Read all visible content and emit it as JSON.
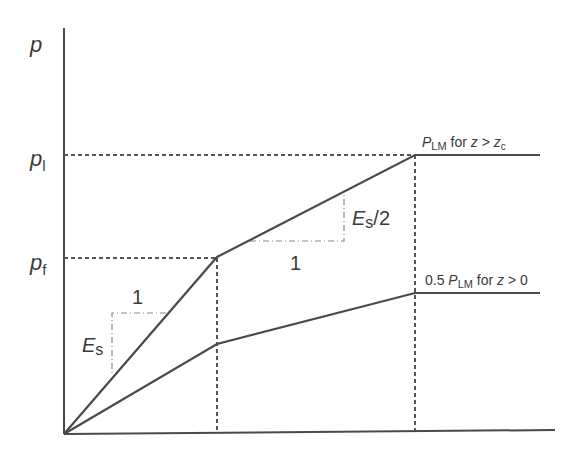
{
  "diagram": {
    "type": "p-y curve (bilinear with plateau)",
    "y_axis_label": "p",
    "y_ticks": [
      {
        "base": "p",
        "sub": "l"
      },
      {
        "base": "p",
        "sub": "f"
      }
    ],
    "slope_labels": {
      "initial": {
        "rise": "E",
        "rise_sub": "s",
        "run": "1"
      },
      "second": {
        "rise": "E",
        "rise_sub": "s",
        "rise_suffix": "/2",
        "run": "1"
      }
    },
    "curve_labels": {
      "upper": {
        "prefix": "",
        "base": "P",
        "sub": "LM",
        "suffix": " for ",
        "var": "z",
        "op": " > ",
        "var2": "z",
        "var2_sub": "c"
      },
      "lower": {
        "prefix": "0.5 ",
        "base": "P",
        "sub": "LM",
        "suffix": " for ",
        "var": "z",
        "op": " > ",
        "value": "0"
      }
    },
    "colors": {
      "line": "#4a4a4a",
      "dash": "#555555",
      "text": "#3a3a3a"
    }
  }
}
